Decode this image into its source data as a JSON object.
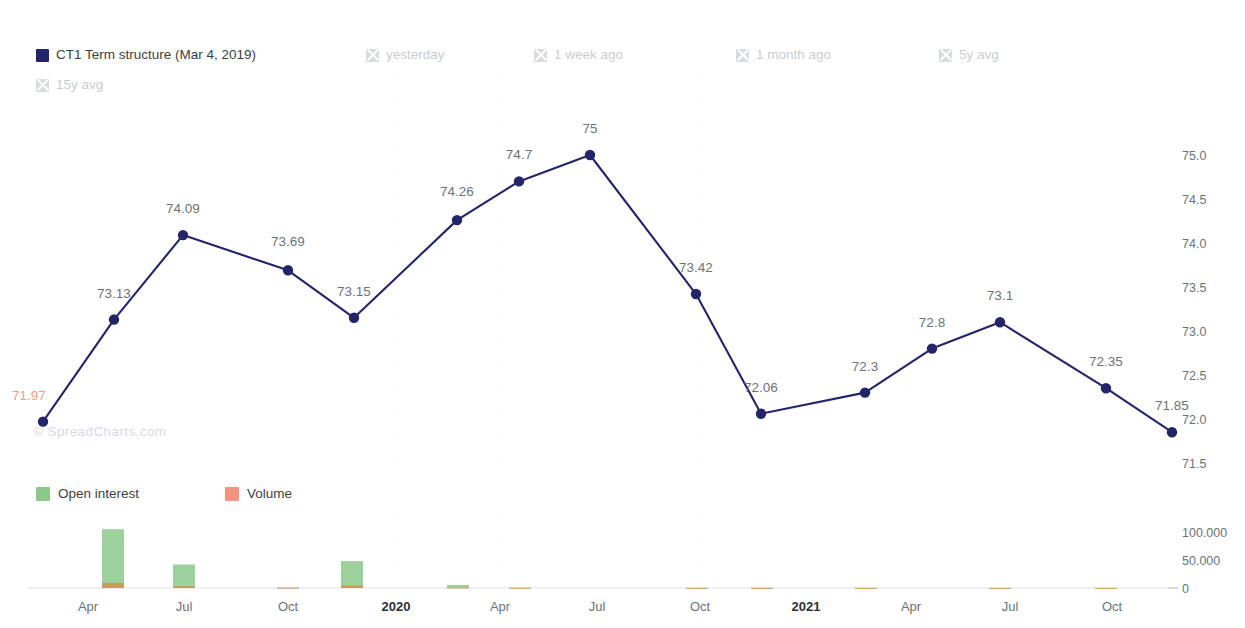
{
  "legend": {
    "items": [
      {
        "label": "CT1 Term structure (Mar 4, 2019)",
        "active": true,
        "color": "#24246b",
        "icon": "square-swatch"
      },
      {
        "label": "yesterday",
        "active": false,
        "icon": "x-swatch"
      },
      {
        "label": "1 week ago",
        "active": false,
        "icon": "x-swatch"
      },
      {
        "label": "1 month ago",
        "active": false,
        "icon": "x-swatch"
      },
      {
        "label": "5y avg",
        "active": false,
        "icon": "x-swatch"
      },
      {
        "label": "15y avg",
        "active": false,
        "icon": "x-swatch"
      }
    ]
  },
  "bar_legend": {
    "items": [
      {
        "label": "Open interest",
        "color": "#8cc98a",
        "icon": "square-swatch"
      },
      {
        "label": "Volume",
        "color": "#f4937e",
        "icon": "square-swatch"
      }
    ]
  },
  "watermark": "© SpreadCharts.com",
  "colors": {
    "line": "#24246b",
    "marker": "#24246b",
    "open_interest": "#8cc98a",
    "volume": "#d9873f",
    "first_label": "#f0a07a",
    "axis_text": "#6c7278",
    "grid": "#eceef1"
  },
  "chart_data": [
    {
      "type": "line",
      "title": "",
      "xlabel": "",
      "ylabel": "",
      "ylim": [
        71.35,
        75.25
      ],
      "yticks": [
        "71.5",
        "72.0",
        "72.5",
        "73.0",
        "73.5",
        "74.0",
        "74.5",
        "75.0"
      ],
      "ytick_values": [
        71.5,
        72.0,
        72.5,
        73.0,
        73.5,
        74.0,
        74.5,
        75.0
      ],
      "grid": true,
      "legend_position": "top-left",
      "series_name": "CT1 Term structure (Mar 4, 2019)",
      "x": [
        "Mar 2019",
        "Apr 2019",
        "May 2019",
        "Jun 2019",
        "Jul 2019",
        "Aug 2019",
        "Sep 2019",
        "Oct 2019",
        "Nov 2019",
        "Dec 2019",
        "Jan 2020",
        "Feb 2020",
        "Mar 2020",
        "Apr 2020",
        "May 2020",
        "Jun 2020",
        "Jul 2020",
        "Aug 2020",
        "Sep 2020",
        "Oct 2020",
        "Nov 2020",
        "Dec 2020"
      ],
      "x_px": [
        43,
        114,
        183,
        253,
        323,
        393,
        459,
        529,
        593,
        663,
        731,
        800,
        868,
        935,
        1000,
        1106,
        1172
      ],
      "values": [
        71.97,
        73.13,
        74.09,
        73.69,
        73.15,
        74.26,
        74.7,
        75,
        73.42,
        72.06,
        72.3,
        72.8,
        73.1,
        72.35,
        71.85
      ],
      "labels": [
        "71.97",
        "73.13",
        "74.09",
        "73.69",
        "73.15",
        "74.26",
        "74.7",
        "75",
        "73.42",
        "72.06",
        "72.3",
        "72.8",
        "73.1",
        "72.35",
        "71.85"
      ],
      "points": [
        {
          "label": "71.97",
          "value": 71.97,
          "px": 43,
          "label_dx": -14,
          "label_dy": -22,
          "highlight": true
        },
        {
          "label": "73.13",
          "value": 73.13,
          "px": 114,
          "label_dx": 0,
          "label_dy": -22
        },
        {
          "label": "74.09",
          "value": 74.09,
          "px": 183,
          "label_dx": 0,
          "label_dy": -22
        },
        {
          "label": "73.69",
          "value": 73.69,
          "px": 288,
          "label_dx": 0,
          "label_dy": -24
        },
        {
          "label": "73.15",
          "value": 73.15,
          "px": 354,
          "label_dx": 0,
          "label_dy": -22
        },
        {
          "label": "74.26",
          "value": 74.26,
          "px": 457,
          "label_dx": 0,
          "label_dy": -24
        },
        {
          "label": "74.7",
          "value": 74.7,
          "px": 519,
          "label_dx": 0,
          "label_dy": -22
        },
        {
          "label": "75",
          "value": 75.0,
          "px": 590,
          "label_dx": 0,
          "label_dy": -22
        },
        {
          "label": "73.42",
          "value": 73.42,
          "px": 696,
          "label_dx": 0,
          "label_dy": -22
        },
        {
          "label": "72.06",
          "value": 72.06,
          "px": 761,
          "label_dx": 0,
          "label_dy": -22
        },
        {
          "label": "72.3",
          "value": 72.3,
          "px": 865,
          "label_dx": 0,
          "label_dy": -22
        },
        {
          "label": "72.8",
          "value": 72.8,
          "px": 932,
          "label_dx": 0,
          "label_dy": -22
        },
        {
          "label": "73.1",
          "value": 73.1,
          "px": 1000,
          "label_dx": 0,
          "label_dy": -22
        },
        {
          "label": "72.35",
          "value": 72.35,
          "px": 1106,
          "label_dx": 0,
          "label_dy": -22
        },
        {
          "label": "71.85",
          "value": 71.85,
          "px": 1172,
          "label_dx": 0,
          "label_dy": -22
        }
      ]
    },
    {
      "type": "bar",
      "title": "",
      "ylim": [
        0,
        115000
      ],
      "yticks": [
        "100.000",
        "50.000",
        "0"
      ],
      "ytick_values": [
        100000,
        50000,
        0
      ],
      "grid": true,
      "legend_position": "top-left",
      "categories": [
        "Apr",
        "Jul",
        "Oct",
        "2020",
        "Apr",
        "Jul",
        "Oct",
        "2021",
        "Apr",
        "Jul",
        "Oct"
      ],
      "series": [
        {
          "name": "Open interest",
          "values": [
            105000,
            42000,
            900,
            48000,
            5500,
            600,
            300,
            400,
            250,
            200,
            150
          ]
        },
        {
          "name": "Volume",
          "values": [
            9000,
            3200,
            300,
            4200,
            600,
            150,
            100,
            100,
            80,
            60,
            50
          ]
        }
      ],
      "bars_px": [
        {
          "px": 113,
          "open_interest": 105000,
          "volume": 9000
        },
        {
          "px": 184,
          "open_interest": 42000,
          "volume": 3200
        },
        {
          "px": 288,
          "open_interest": 900,
          "volume": 300
        },
        {
          "px": 352,
          "open_interest": 48000,
          "volume": 4200
        },
        {
          "px": 458,
          "open_interest": 5500,
          "volume": 600
        },
        {
          "px": 520,
          "open_interest": 600,
          "volume": 150
        },
        {
          "px": 697,
          "open_interest": 300,
          "volume": 100
        },
        {
          "px": 762,
          "open_interest": 400,
          "volume": 100
        },
        {
          "px": 866,
          "open_interest": 250,
          "volume": 80
        },
        {
          "px": 1000,
          "open_interest": 200,
          "volume": 60
        },
        {
          "px": 1106,
          "open_interest": 150,
          "volume": 50
        }
      ]
    }
  ],
  "xaxis": {
    "ticks": [
      {
        "label": "Apr",
        "px": 88,
        "bold": false
      },
      {
        "label": "Jul",
        "px": 184,
        "bold": false
      },
      {
        "label": "Oct",
        "px": 288,
        "bold": false
      },
      {
        "label": "2020",
        "px": 396,
        "bold": true
      },
      {
        "label": "Apr",
        "px": 500,
        "bold": false
      },
      {
        "label": "Jul",
        "px": 597,
        "bold": false
      },
      {
        "label": "Oct",
        "px": 700,
        "bold": false
      },
      {
        "label": "2021",
        "px": 806,
        "bold": true
      },
      {
        "label": "Apr",
        "px": 911,
        "bold": false
      },
      {
        "label": "Jul",
        "px": 1010,
        "bold": false
      },
      {
        "label": "Oct",
        "px": 1112,
        "bold": false
      }
    ]
  }
}
